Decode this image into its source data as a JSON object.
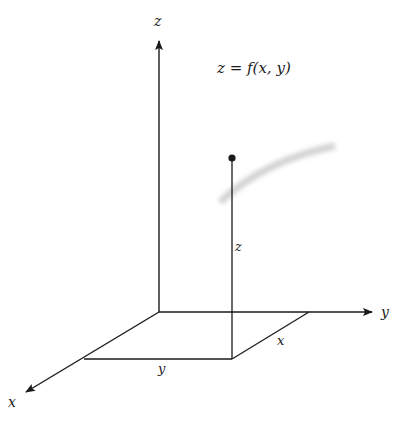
{
  "diagram": {
    "equation": "z = f(x, y)",
    "axes": {
      "z_label": "z",
      "y_label": "y",
      "x_label": "x"
    },
    "segment_labels": {
      "height": "z",
      "base_y": "y",
      "base_x": "x"
    },
    "colors": {
      "line": "#1a1a1a",
      "smudge": "#c8c8c8"
    }
  }
}
